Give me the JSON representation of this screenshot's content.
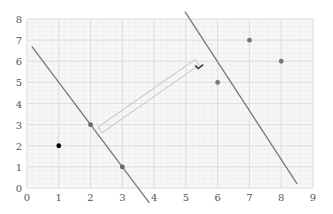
{
  "chart_data": {
    "type": "scatter",
    "title": "",
    "xlabel": "",
    "ylabel": "",
    "xlim": [
      0,
      9
    ],
    "ylim": [
      0,
      8
    ],
    "grid": true,
    "minor_grid": true,
    "x_ticks": [
      "0",
      "1",
      "2",
      "3",
      "4",
      "5",
      "6",
      "7",
      "8",
      "9"
    ],
    "y_ticks": [
      "0",
      "1",
      "2",
      "3",
      "4",
      "5",
      "6",
      "7",
      "8"
    ],
    "series": [
      {
        "name": "class-negative",
        "marker": "circle",
        "color": "#000000",
        "points": [
          {
            "x": 1,
            "y": 2
          }
        ]
      },
      {
        "name": "class-support-left",
        "marker": "circle",
        "color": "#666666",
        "points": [
          {
            "x": 2,
            "y": 3
          },
          {
            "x": 3,
            "y": 1
          }
        ]
      },
      {
        "name": "class-positive",
        "marker": "circle",
        "color": "#777777",
        "points": [
          {
            "x": 6,
            "y": 5
          },
          {
            "x": 7,
            "y": 7
          },
          {
            "x": 8,
            "y": 6
          }
        ]
      }
    ],
    "lines": [
      {
        "name": "left-boundary",
        "equation": "y = -2x + 7",
        "x1": 0.15,
        "y1": 6.7,
        "x2": 3.85,
        "y2": -0.7,
        "color": "#777777"
      },
      {
        "name": "right-boundary",
        "equation": "y = -2x + 17",
        "x1": 4.97,
        "y1": 8.35,
        "x2": 8.5,
        "y2": 0.2,
        "color": "#777777"
      }
    ],
    "annotations": [
      {
        "type": "margin-bracket",
        "from": {
          "x": 2.3,
          "y": 2.75
        },
        "to": {
          "x": 5.35,
          "y": 5.95
        },
        "color": "#cccccc"
      },
      {
        "type": "checkmark",
        "x": 5.45,
        "y": 5.7,
        "color": "#333333"
      }
    ]
  }
}
